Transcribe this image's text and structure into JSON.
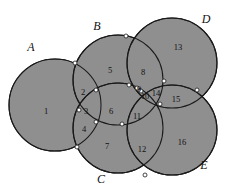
{
  "figure": {
    "type": "venn-diagram",
    "background_color": "#ffffff",
    "fill_color": "#8f8f8f",
    "stroke_color": "#1a1a1a",
    "vertex_fill_color": "#ffffff",
    "width": 225,
    "height": 193
  },
  "sets": [
    {
      "label": "A",
      "cx": 55,
      "cy": 105,
      "r": 46,
      "label_x": 31,
      "label_y": 48
    },
    {
      "label": "B",
      "cx": 118,
      "cy": 80,
      "r": 45,
      "label_x": 97,
      "label_y": 27
    },
    {
      "label": "C",
      "cx": 118,
      "cy": 128,
      "r": 45,
      "label_x": 101,
      "label_y": 180
    },
    {
      "label": "D",
      "cx": 172,
      "cy": 63,
      "r": 45,
      "label_x": 206,
      "label_y": 20
    },
    {
      "label": "E",
      "cx": 172,
      "cy": 130,
      "r": 45,
      "label_x": 204,
      "label_y": 166
    }
  ],
  "regions": [
    {
      "id": "1",
      "x": 46,
      "y": 112
    },
    {
      "id": "2",
      "x": 83,
      "y": 93
    },
    {
      "id": "3",
      "x": 86,
      "y": 112
    },
    {
      "id": "4",
      "x": 84,
      "y": 130
    },
    {
      "id": "5",
      "x": 110,
      "y": 71
    },
    {
      "id": "6",
      "x": 111,
      "y": 112
    },
    {
      "id": "7",
      "x": 107,
      "y": 147
    },
    {
      "id": "8",
      "x": 143,
      "y": 73
    },
    {
      "id": "9",
      "x": 139,
      "y": 90
    },
    {
      "id": "10",
      "x": 145,
      "y": 97
    },
    {
      "id": "11",
      "x": 137,
      "y": 117
    },
    {
      "id": "12",
      "x": 142,
      "y": 150
    },
    {
      "id": "13",
      "x": 178,
      "y": 48
    },
    {
      "id": "14",
      "x": 156,
      "y": 94
    },
    {
      "id": "15",
      "x": 176,
      "y": 100
    },
    {
      "id": "16",
      "x": 182,
      "y": 143
    }
  ],
  "vertices": [
    {
      "name": "A-B-top",
      "x": 75,
      "y": 63
    },
    {
      "name": "A-B-C-upper",
      "x": 96,
      "y": 90
    },
    {
      "name": "A-B-C-mid",
      "x": 79,
      "y": 110
    },
    {
      "name": "A-B-C-lower",
      "x": 96,
      "y": 122
    },
    {
      "name": "A-C-bottom",
      "x": 77,
      "y": 147
    },
    {
      "name": "B-D-top",
      "x": 126,
      "y": 36
    },
    {
      "name": "B-D-lower",
      "x": 129,
      "y": 85
    },
    {
      "name": "B-C-D-upper",
      "x": 137,
      "y": 88
    },
    {
      "name": "B-D-E-inner",
      "x": 141,
      "y": 91
    },
    {
      "name": "B-C-right",
      "x": 122,
      "y": 124
    },
    {
      "name": "D-E-upper",
      "x": 164,
      "y": 81
    },
    {
      "name": "C-D-E-center",
      "x": 160,
      "y": 104
    },
    {
      "name": "D-E-right",
      "x": 197,
      "y": 90
    },
    {
      "name": "C-E-bottom",
      "x": 145,
      "y": 175
    }
  ],
  "legend": {
    "region_count": 16,
    "set_count": 5
  }
}
